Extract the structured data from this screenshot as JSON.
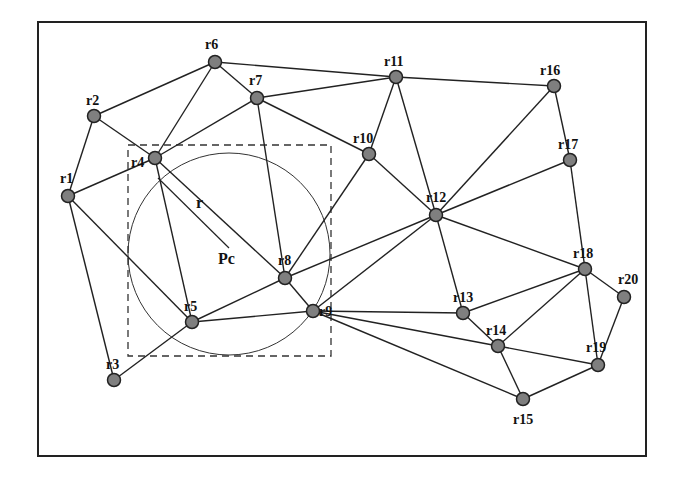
{
  "diagram": {
    "title": "",
    "frame": {
      "x": 38,
      "y": 22,
      "width": 270,
      "height": 196
    },
    "circle": {
      "cx": 229,
      "cy": 254,
      "r": 101,
      "center_label": "Pc",
      "radius_label": "r"
    },
    "bounding_box": {
      "x": 128,
      "y": 145,
      "width": 203,
      "height": 211
    },
    "nodes": [
      {
        "id": "r1",
        "label": "r1",
        "x": 68,
        "y": 196
      },
      {
        "id": "r2",
        "label": "r2",
        "x": 94,
        "y": 116
      },
      {
        "id": "r3",
        "label": "r3",
        "x": 114,
        "y": 380
      },
      {
        "id": "r4",
        "label": "r4",
        "x": 155,
        "y": 158
      },
      {
        "id": "r5",
        "label": "r5",
        "x": 192,
        "y": 322
      },
      {
        "id": "r6",
        "label": "r6",
        "x": 215,
        "y": 62
      },
      {
        "id": "r7",
        "label": "r7",
        "x": 257,
        "y": 98
      },
      {
        "id": "r8",
        "label": "r8",
        "x": 285,
        "y": 278
      },
      {
        "id": "r9",
        "label": "r9",
        "x": 313,
        "y": 311
      },
      {
        "id": "r10",
        "label": "r10",
        "x": 369,
        "y": 154
      },
      {
        "id": "r11",
        "label": "r11",
        "x": 396,
        "y": 77
      },
      {
        "id": "r12",
        "label": "r12",
        "x": 436,
        "y": 215
      },
      {
        "id": "r13",
        "label": "r13",
        "x": 463,
        "y": 313
      },
      {
        "id": "r14",
        "label": "r14",
        "x": 498,
        "y": 346
      },
      {
        "id": "r15",
        "label": "r15",
        "x": 523,
        "y": 399
      },
      {
        "id": "r16",
        "label": "r16",
        "x": 554,
        "y": 86
      },
      {
        "id": "r17",
        "label": "r17",
        "x": 570,
        "y": 160
      },
      {
        "id": "r18",
        "label": "r18",
        "x": 585,
        "y": 269
      },
      {
        "id": "r19",
        "label": "r19",
        "x": 598,
        "y": 365
      },
      {
        "id": "r20",
        "label": "r20",
        "x": 624,
        "y": 297
      }
    ],
    "edges": [
      [
        "r1",
        "r2"
      ],
      [
        "r1",
        "r4"
      ],
      [
        "r1",
        "r3"
      ],
      [
        "r1",
        "r5"
      ],
      [
        "r2",
        "r6"
      ],
      [
        "r2",
        "r4"
      ],
      [
        "r4",
        "r6"
      ],
      [
        "r4",
        "r7"
      ],
      [
        "r4",
        "r5"
      ],
      [
        "r4",
        "r8"
      ],
      [
        "r6",
        "r7"
      ],
      [
        "r6",
        "r11"
      ],
      [
        "r7",
        "r11"
      ],
      [
        "r7",
        "r8"
      ],
      [
        "r7",
        "r10"
      ],
      [
        "r5",
        "r3"
      ],
      [
        "r5",
        "r8"
      ],
      [
        "r5",
        "r9"
      ],
      [
        "r8",
        "r9"
      ],
      [
        "r8",
        "r10"
      ],
      [
        "r8",
        "r12"
      ],
      [
        "r9",
        "r12"
      ],
      [
        "r9",
        "r13"
      ],
      [
        "r9",
        "r14"
      ],
      [
        "r9",
        "r15"
      ],
      [
        "r10",
        "r11"
      ],
      [
        "r10",
        "r12"
      ],
      [
        "r11",
        "r12"
      ],
      [
        "r11",
        "r16"
      ],
      [
        "r12",
        "r16"
      ],
      [
        "r12",
        "r17"
      ],
      [
        "r12",
        "r18"
      ],
      [
        "r12",
        "r13"
      ],
      [
        "r16",
        "r17"
      ],
      [
        "r17",
        "r18"
      ],
      [
        "r13",
        "r14"
      ],
      [
        "r13",
        "r18"
      ],
      [
        "r14",
        "r18"
      ],
      [
        "r14",
        "r15"
      ],
      [
        "r14",
        "r19"
      ],
      [
        "r18",
        "r19"
      ],
      [
        "r18",
        "r20"
      ],
      [
        "r19",
        "r20"
      ],
      [
        "r19",
        "r15"
      ]
    ]
  }
}
